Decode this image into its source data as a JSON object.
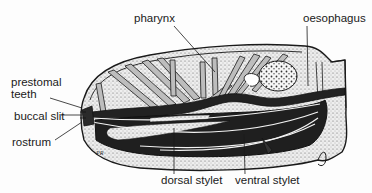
{
  "figure": {
    "type": "labeled anatomical diagram",
    "artist_initials": "PR"
  },
  "labels": {
    "pharynx": "pharynx",
    "oesophagus": "oesophagus",
    "prestomal_teeth_line1": "prestomal",
    "prestomal_teeth_line2": "teeth",
    "buccal_slit": "buccal slit",
    "rostrum": "rostrum",
    "dorsal_stylet": "dorsal stylet",
    "ventral_stylet": "ventral stylet"
  },
  "colors": {
    "ink": "#1a1a1a",
    "stipple_bg": "#d9d9d9",
    "dark_fill": "#222222",
    "paper": "#fdfdfd"
  }
}
